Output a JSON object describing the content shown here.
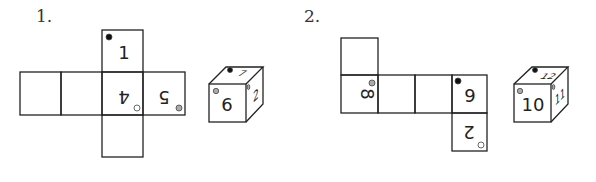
{
  "problems": [
    {
      "label": "1.",
      "net_faces": {
        "top": "1",
        "center": "4",
        "right": "5"
      },
      "cube_faces": {
        "front": "6",
        "top": "7",
        "right": "2"
      }
    },
    {
      "label": "2.",
      "net_faces": {
        "left": "8",
        "right": "9",
        "bottom": "2"
      },
      "cube_faces": {
        "front": "10",
        "top": "12",
        "right": "11"
      }
    }
  ],
  "colors": {
    "line": "#222222",
    "black_dot": "#111111",
    "gray_dot": "#aaaaaa",
    "white_dot": "#ffffff"
  }
}
